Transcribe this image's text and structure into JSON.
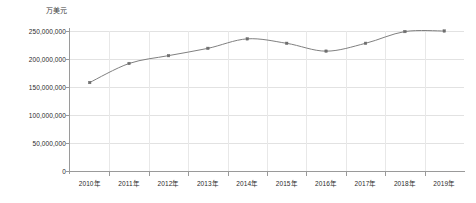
{
  "chart_data": {
    "type": "line",
    "title": "",
    "subtitle": "",
    "unit_label": "万美元",
    "xlabel": "",
    "ylabel": "",
    "categories": [
      "2010年",
      "2011年",
      "2012年",
      "2013年",
      "2014年",
      "2015年",
      "2016年",
      "2017年",
      "2018年",
      "2019年"
    ],
    "series": [
      {
        "name": "",
        "values": [
          158000000,
          192000000,
          206000000,
          219000000,
          236000000,
          228000000,
          214000000,
          228000000,
          249000000,
          250000000
        ]
      }
    ],
    "ylim": [
      0,
      250000000
    ],
    "ytick_values": [
      0,
      50000000,
      100000000,
      150000000,
      200000000,
      250000000
    ],
    "ytick_labels": [
      "0",
      "50,000,000",
      "100,000,000",
      "150,000,000",
      "200,000,000",
      "250,000,000"
    ],
    "grid": true,
    "grid_axis": "both",
    "legend": false,
    "legend_position": "none",
    "markers": true,
    "colors": {
      "line": "#808080",
      "marker": "#6e6e6e",
      "grid": "#e2e2e2",
      "axis": "#9a9a9a",
      "text": "#2b2b2b",
      "background": "#ffffff"
    }
  }
}
